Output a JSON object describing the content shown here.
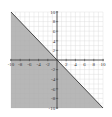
{
  "chart_data": {
    "type": "line",
    "title": "",
    "xlabel": "",
    "ylabel": "",
    "xlim": [
      -10,
      10
    ],
    "ylim": [
      -10,
      10
    ],
    "grid": true,
    "x_ticks": [
      -10,
      -8,
      -6,
      -4,
      -2,
      2,
      4,
      6,
      8,
      10
    ],
    "y_ticks": [
      10,
      8,
      6,
      4,
      2,
      -2,
      -4,
      -6,
      -8,
      -10
    ],
    "x_tick_labels": [
      "-10",
      "-8",
      "-6",
      "-4",
      "-2",
      "2",
      "4",
      "6",
      "8",
      "10"
    ],
    "y_tick_labels": [
      "10",
      "8",
      "6",
      "4",
      "2",
      "-2",
      "-4",
      "-6",
      "-8",
      "-10"
    ],
    "series": [
      {
        "name": "boundary line y = -x",
        "x": [
          -10,
          10
        ],
        "y": [
          10,
          -10
        ],
        "style": "solid"
      }
    ],
    "shaded_region": {
      "description": "y <= -x (below/left of line)",
      "vertices": [
        [
          -10,
          10
        ],
        [
          10,
          -10
        ],
        [
          -10,
          -10
        ]
      ],
      "color": "#aaaaaa"
    },
    "colors": {
      "shade": "#aaaaaa",
      "line": "#333333",
      "grid": "#d8d8d8",
      "axis": "#333333"
    }
  }
}
